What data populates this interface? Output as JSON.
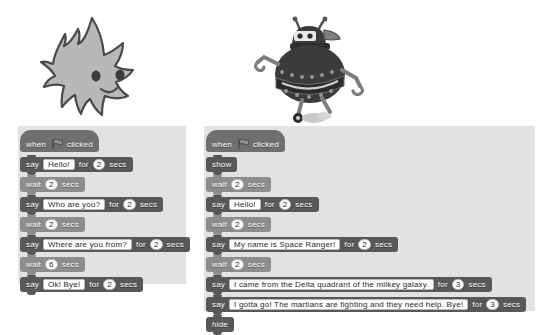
{
  "stage": {
    "sprites": [
      {
        "name": "gobo-sprite",
        "label": "Gobo"
      },
      {
        "name": "space-ranger-robot-sprite",
        "label": "Space Ranger"
      }
    ]
  },
  "colors": {
    "background": "#ffffff",
    "panel": "#e2e2e2",
    "events_block": "#6f6f6f",
    "looks_block": "#585858",
    "control_block": "#8d8d8d",
    "field_background": "#fdfdfd",
    "block_text": "#ffffff"
  },
  "icons": {
    "green_flag": "green-flag-icon"
  },
  "scripts": [
    {
      "id": "left-script",
      "name": "gobo-script",
      "blocks": [
        {
          "type": "hat",
          "category": "event",
          "words": [
            "when",
            "clicked"
          ],
          "flag": true
        },
        {
          "type": "stack",
          "category": "looks",
          "words": [
            "say",
            "for",
            "secs"
          ],
          "text": "Hello!",
          "num": "2"
        },
        {
          "type": "stack",
          "category": "control",
          "words": [
            "wait",
            "secs"
          ],
          "num": "2"
        },
        {
          "type": "stack",
          "category": "looks",
          "words": [
            "say",
            "for",
            "secs"
          ],
          "text": "Who are you?",
          "num": "2"
        },
        {
          "type": "stack",
          "category": "control",
          "words": [
            "wait",
            "secs"
          ],
          "num": "2"
        },
        {
          "type": "stack",
          "category": "looks",
          "words": [
            "say",
            "for",
            "secs"
          ],
          "text": "Where are you from?",
          "num": "2"
        },
        {
          "type": "stack",
          "category": "control",
          "words": [
            "wait",
            "secs"
          ],
          "num": "6"
        },
        {
          "type": "stack",
          "category": "looks",
          "words": [
            "say",
            "for",
            "secs"
          ],
          "text": "Ok! Bye!",
          "num": "2"
        }
      ]
    },
    {
      "id": "right-script",
      "name": "space-ranger-script",
      "blocks": [
        {
          "type": "hat",
          "category": "event",
          "words": [
            "when",
            "clicked"
          ],
          "flag": true
        },
        {
          "type": "stack",
          "category": "looks",
          "words": [
            "show"
          ]
        },
        {
          "type": "stack",
          "category": "control",
          "words": [
            "wait",
            "secs"
          ],
          "num": "2"
        },
        {
          "type": "stack",
          "category": "looks",
          "words": [
            "say",
            "for",
            "secs"
          ],
          "text": "Hello!",
          "num": "2"
        },
        {
          "type": "stack",
          "category": "control",
          "words": [
            "wait",
            "secs"
          ],
          "num": "2"
        },
        {
          "type": "stack",
          "category": "looks",
          "words": [
            "say",
            "for",
            "secs"
          ],
          "text": "My name is Space Ranger!",
          "num": "2"
        },
        {
          "type": "stack",
          "category": "control",
          "words": [
            "wait",
            "secs"
          ],
          "num": "2"
        },
        {
          "type": "stack",
          "category": "looks",
          "words": [
            "say",
            "for",
            "secs"
          ],
          "text": "I came from the Delta quadrant of the milkey galaxy.",
          "num": "3"
        },
        {
          "type": "stack",
          "category": "looks",
          "words": [
            "say",
            "for",
            "secs"
          ],
          "text": "I gotta go! The martians are fighting and they need help. Bye!",
          "num": "3"
        },
        {
          "type": "stack",
          "category": "looks",
          "words": [
            "hide"
          ]
        }
      ]
    }
  ]
}
